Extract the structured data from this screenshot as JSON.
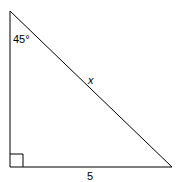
{
  "diagram": {
    "type": "right-triangle",
    "angle_label": "45°",
    "hypotenuse_label": "x",
    "base_label": "5",
    "right_angle_marker": true,
    "stroke_color": "#000000"
  }
}
